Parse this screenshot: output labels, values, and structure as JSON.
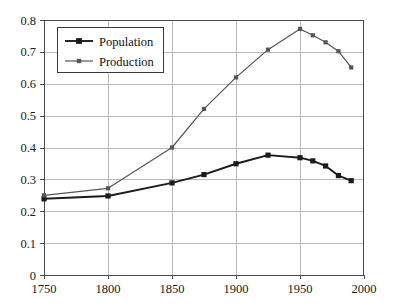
{
  "chart_data": {
    "type": "line",
    "title": "",
    "subtitle": "",
    "xlabel": "",
    "ylabel": "",
    "xlim": [
      1750,
      2000
    ],
    "ylim": [
      0,
      0.8
    ],
    "grid": true,
    "legend_position": "top-left",
    "xticks": [
      "1750",
      "1800",
      "1850",
      "1900",
      "1950",
      "2000"
    ],
    "xtick_values": [
      1750,
      1800,
      1850,
      1900,
      1950,
      2000
    ],
    "yticks": [
      "0",
      "0.1",
      "0.2",
      "0.3",
      "0.4",
      "0.5",
      "0.6",
      "0.7",
      "0.8"
    ],
    "ytick_values": [
      0,
      0.1,
      0.2,
      0.3,
      0.4,
      0.5,
      0.6,
      0.7,
      0.8
    ],
    "series": [
      {
        "name": "Population",
        "color": "#1b1b1b",
        "marker": "square",
        "x": [
          1750,
          1800,
          1850,
          1875,
          1900,
          1925,
          1950,
          1960,
          1970,
          1980,
          1990
        ],
        "values": [
          0.239,
          0.248,
          0.289,
          0.315,
          0.349,
          0.376,
          0.368,
          0.358,
          0.342,
          0.312,
          0.296
        ]
      },
      {
        "name": "Production",
        "color": "#555555",
        "marker": "square",
        "x": [
          1750,
          1800,
          1850,
          1875,
          1900,
          1925,
          1950,
          1960,
          1970,
          1980,
          1990
        ],
        "values": [
          0.25,
          0.272,
          0.4,
          0.521,
          0.62,
          0.707,
          0.772,
          0.752,
          0.73,
          0.702,
          0.651
        ]
      }
    ]
  },
  "legend": {
    "entries": [
      {
        "label": "Population"
      },
      {
        "label": "Production"
      }
    ]
  }
}
